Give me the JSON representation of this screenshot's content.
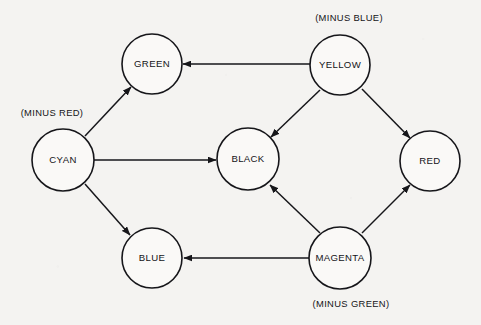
{
  "diagram": {
    "background_color": "#f4f3f1",
    "stroke_color": "#16161a",
    "nodes": [
      {
        "id": "green",
        "label": "GREEN",
        "cx": 152,
        "cy": 64,
        "r": 30
      },
      {
        "id": "yellow",
        "label": "YELLOW",
        "cx": 340,
        "cy": 65,
        "r": 30
      },
      {
        "id": "cyan",
        "label": "CYAN",
        "cx": 63,
        "cy": 160,
        "r": 31
      },
      {
        "id": "black",
        "label": "BLACK",
        "cx": 248,
        "cy": 159,
        "r": 31
      },
      {
        "id": "red",
        "label": "RED",
        "cx": 430,
        "cy": 161,
        "r": 30
      },
      {
        "id": "blue",
        "label": "BLUE",
        "cx": 152,
        "cy": 258,
        "r": 30
      },
      {
        "id": "magenta",
        "label": "MAGENTA",
        "cx": 340,
        "cy": 258,
        "r": 31
      }
    ],
    "annotations": [
      {
        "id": "minus-red",
        "text": "(MINUS RED)",
        "x": 52,
        "y": 116
      },
      {
        "id": "minus-blue",
        "text": "(MINUS BLUE)",
        "x": 349,
        "y": 21
      },
      {
        "id": "minus-green",
        "text": "(MINUS GREEN)",
        "x": 351,
        "y": 307
      }
    ],
    "edges": [
      {
        "id": "yellow-to-green",
        "from": "yellow",
        "to": "green",
        "x1": 310,
        "y1": 64,
        "x2": 183,
        "y2": 64
      },
      {
        "id": "cyan-to-green",
        "from": "cyan",
        "to": "green",
        "x1": 85,
        "y1": 136,
        "x2": 131,
        "y2": 87
      },
      {
        "id": "cyan-to-black",
        "from": "cyan",
        "to": "black",
        "x1": 94,
        "y1": 160,
        "x2": 216,
        "y2": 160
      },
      {
        "id": "cyan-to-blue",
        "from": "cyan",
        "to": "blue",
        "x1": 85,
        "y1": 184,
        "x2": 130,
        "y2": 235
      },
      {
        "id": "yellow-to-black",
        "from": "yellow",
        "to": "black",
        "x1": 320,
        "y1": 90,
        "x2": 271,
        "y2": 137
      },
      {
        "id": "yellow-to-red",
        "from": "yellow",
        "to": "red",
        "x1": 362,
        "y1": 89,
        "x2": 410,
        "y2": 138
      },
      {
        "id": "magenta-to-black",
        "from": "magenta",
        "to": "black",
        "x1": 320,
        "y1": 233,
        "x2": 270,
        "y2": 185
      },
      {
        "id": "magenta-to-red",
        "from": "magenta",
        "to": "red",
        "x1": 362,
        "y1": 233,
        "x2": 410,
        "y2": 185
      },
      {
        "id": "magenta-to-blue",
        "from": "magenta",
        "to": "blue",
        "x1": 309,
        "y1": 258,
        "x2": 184,
        "y2": 258
      }
    ]
  }
}
